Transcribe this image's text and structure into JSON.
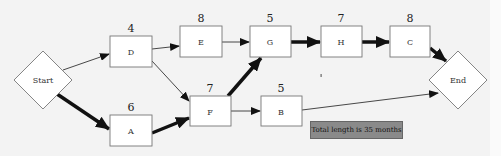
{
  "diagram": {
    "type": "project network / critical path",
    "nodes": {
      "start": {
        "label": "Start",
        "shape": "diamond"
      },
      "end": {
        "label": "End",
        "shape": "diamond"
      },
      "D": {
        "label": "D",
        "duration": "4"
      },
      "A": {
        "label": "A",
        "duration": "6"
      },
      "E": {
        "label": "E",
        "duration": "8"
      },
      "F": {
        "label": "F",
        "duration": "7"
      },
      "G": {
        "label": "G",
        "duration": "5"
      },
      "B": {
        "label": "B",
        "duration": "5"
      },
      "H": {
        "label": "H",
        "duration": "7"
      },
      "C": {
        "label": "C",
        "duration": "8"
      }
    },
    "edges": [
      {
        "from": "Start",
        "to": "D",
        "critical": false
      },
      {
        "from": "Start",
        "to": "A",
        "critical": true
      },
      {
        "from": "D",
        "to": "E",
        "critical": false
      },
      {
        "from": "D",
        "to": "F",
        "critical": false
      },
      {
        "from": "A",
        "to": "F",
        "critical": true
      },
      {
        "from": "E",
        "to": "G",
        "critical": false
      },
      {
        "from": "F",
        "to": "G",
        "critical": true
      },
      {
        "from": "F",
        "to": "B",
        "critical": false
      },
      {
        "from": "G",
        "to": "H",
        "critical": true
      },
      {
        "from": "H",
        "to": "C",
        "critical": true
      },
      {
        "from": "C",
        "to": "End",
        "critical": true
      },
      {
        "from": "B",
        "to": "End",
        "critical": false
      }
    ],
    "total_label": "Total length is 35 months",
    "colors": {
      "background": "#f3f3f3",
      "node_fill": "#ffffff",
      "node_border": "#777777",
      "arrow": "#111111",
      "total_box": "#8a8a8a"
    }
  }
}
